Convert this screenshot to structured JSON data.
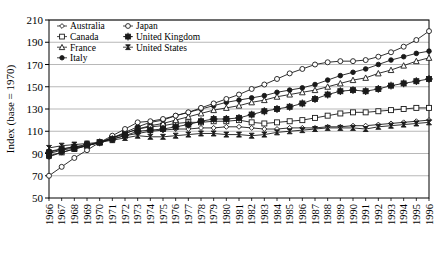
{
  "chart_data": {
    "type": "line",
    "title": "",
    "xlabel": "",
    "ylabel": "Index (base = 1970)",
    "ylim": [
      50,
      210
    ],
    "yticks": [
      50,
      70,
      90,
      110,
      130,
      150,
      170,
      190,
      210
    ],
    "grid": true,
    "legend_position": "top-left",
    "x": [
      1966,
      1967,
      1968,
      1969,
      1970,
      1971,
      1972,
      1973,
      1974,
      1975,
      1976,
      1977,
      1978,
      1979,
      1980,
      1981,
      1982,
      1983,
      1984,
      1985,
      1986,
      1987,
      1988,
      1989,
      1990,
      1991,
      1992,
      1993,
      1994,
      1995,
      1996
    ],
    "categories": [
      "1966",
      "1967",
      "1968",
      "1969",
      "1970",
      "1971",
      "1972",
      "1973",
      "1974",
      "1975",
      "1976",
      "1977",
      "1978",
      "1979",
      "1980",
      "1981",
      "1982",
      "1983",
      "1984",
      "1985",
      "1986",
      "1987",
      "1988",
      "1989",
      "1990",
      "1991",
      "1992",
      "1993",
      "1994",
      "1995",
      "1996"
    ],
    "series": [
      {
        "name": "Australia",
        "marker": "diamond-open",
        "values": [
          92,
          94,
          96,
          97,
          100,
          103,
          106,
          108,
          110,
          111,
          112,
          112,
          113,
          113,
          114,
          114,
          113,
          112,
          112,
          113,
          113,
          113,
          114,
          114,
          115,
          115,
          116,
          117,
          118,
          119,
          120
        ]
      },
      {
        "name": "Canada",
        "marker": "square-open",
        "values": [
          88,
          91,
          94,
          97,
          100,
          104,
          108,
          112,
          114,
          115,
          117,
          118,
          118,
          119,
          119,
          120,
          118,
          117,
          118,
          119,
          120,
          122,
          124,
          126,
          127,
          127,
          128,
          129,
          130,
          131,
          131
        ]
      },
      {
        "name": "France",
        "marker": "triangle-open",
        "values": [
          90,
          93,
          95,
          97,
          100,
          104,
          108,
          112,
          115,
          117,
          120,
          123,
          126,
          129,
          131,
          133,
          136,
          138,
          141,
          143,
          145,
          147,
          150,
          153,
          156,
          158,
          162,
          165,
          169,
          173,
          176
        ]
      },
      {
        "name": "Italy",
        "marker": "circle-filled",
        "values": [
          87,
          91,
          94,
          97,
          100,
          104,
          109,
          114,
          118,
          120,
          124,
          127,
          130,
          133,
          136,
          138,
          140,
          142,
          145,
          147,
          149,
          152,
          156,
          160,
          163,
          166,
          170,
          174,
          177,
          180,
          182
        ]
      },
      {
        "name": "Japan",
        "marker": "circle-open",
        "values": [
          70,
          78,
          86,
          93,
          100,
          106,
          112,
          118,
          119,
          121,
          124,
          127,
          131,
          135,
          139,
          143,
          148,
          152,
          157,
          162,
          166,
          170,
          172,
          173,
          173,
          174,
          177,
          181,
          186,
          192,
          200
        ]
      },
      {
        "name": "United Kingdom",
        "marker": "plus-filled",
        "values": [
          91,
          94,
          96,
          98,
          100,
          103,
          106,
          110,
          111,
          112,
          114,
          116,
          119,
          121,
          121,
          122,
          125,
          128,
          130,
          132,
          135,
          139,
          143,
          146,
          147,
          146,
          148,
          151,
          153,
          155,
          157
        ]
      },
      {
        "name": "United States",
        "marker": "hourglass-filled",
        "values": [
          95,
          97,
          98,
          99,
          100,
          102,
          104,
          106,
          105,
          105,
          106,
          107,
          108,
          108,
          107,
          107,
          106,
          107,
          109,
          110,
          111,
          112,
          113,
          113,
          113,
          112,
          114,
          115,
          116,
          117,
          118
        ]
      }
    ]
  },
  "legend": {
    "entries": [
      {
        "label": "Australia",
        "marker": "diamond-open"
      },
      {
        "label": "Japan",
        "marker": "circle-open"
      },
      {
        "label": "Canada",
        "marker": "square-open"
      },
      {
        "label": "United Kingdom",
        "marker": "plus-filled"
      },
      {
        "label": "France",
        "marker": "triangle-open"
      },
      {
        "label": "United States",
        "marker": "hourglass-filled"
      },
      {
        "label": "Italy",
        "marker": "circle-filled"
      }
    ]
  },
  "colors": {
    "line": "#1a1a1a",
    "grid": "#9a9a9a",
    "axis": "#000000",
    "background": "#ffffff",
    "marker_fill_open": "#ffffff",
    "marker_fill_closed": "#1a1a1a"
  }
}
